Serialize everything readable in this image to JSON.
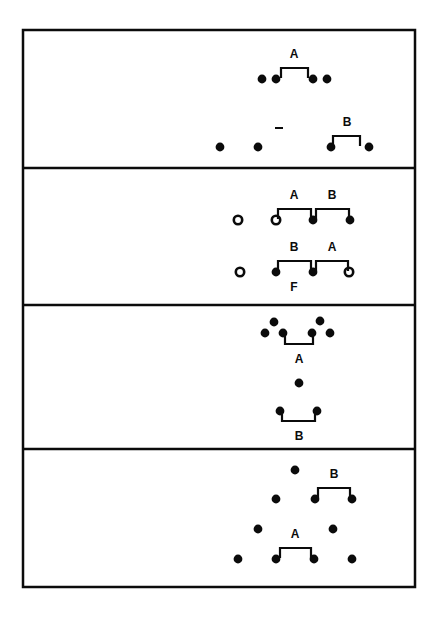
{
  "figure": {
    "background_color": "#ffffff",
    "ink_color": "#0b0b0b",
    "frame": {
      "x": 23,
      "y": 30,
      "width": 392,
      "height": 557,
      "stroke_width": 2.5
    },
    "dividers_y": [
      168,
      305,
      449
    ],
    "dot_radius": 4.4,
    "open_dot_radius": 4.2
  },
  "panels": [
    {
      "id": "panel-1",
      "index": 1,
      "label": "Panel 1",
      "bounds": {
        "x": 23,
        "y": 30,
        "width": 392,
        "height": 138
      },
      "dots": [
        {
          "id": "p1-d1",
          "x": 262,
          "y": 79,
          "fill": "filled"
        },
        {
          "id": "p1-d2",
          "x": 276,
          "y": 79,
          "fill": "filled"
        },
        {
          "id": "p1-d3",
          "x": 313,
          "y": 79,
          "fill": "filled"
        },
        {
          "id": "p1-d4",
          "x": 327,
          "y": 79,
          "fill": "filled"
        },
        {
          "id": "p1-d5",
          "x": 220,
          "y": 147,
          "fill": "filled"
        },
        {
          "id": "p1-d6",
          "x": 258,
          "y": 147,
          "fill": "filled"
        },
        {
          "id": "p1-d7",
          "x": 331,
          "y": 147,
          "fill": "filled"
        },
        {
          "id": "p1-d8",
          "x": 369,
          "y": 147,
          "fill": "filled"
        }
      ],
      "brackets": [
        {
          "id": "p1-bracket-a",
          "label": "A",
          "x1": 281,
          "x2": 308,
          "y": 68,
          "depth": 10,
          "orientation": "up",
          "label_x": 294,
          "label_y": 55
        },
        {
          "id": "p1-bracket-b",
          "label": "B",
          "x1": 333,
          "x2": 360,
          "y": 136,
          "depth": 10,
          "orientation": "up",
          "label_x": 347,
          "label_y": 123
        }
      ],
      "marks": [
        {
          "id": "p1-dash",
          "type": "dash",
          "x1": 275,
          "x2": 283,
          "y": 128
        }
      ]
    },
    {
      "id": "panel-2",
      "index": 2,
      "label": "Panel 2",
      "bounds": {
        "x": 23,
        "y": 168,
        "width": 392,
        "height": 137
      },
      "dots": [
        {
          "id": "p2-d1",
          "x": 238,
          "y": 220,
          "fill": "open"
        },
        {
          "id": "p2-d2",
          "x": 276,
          "y": 220,
          "fill": "open"
        },
        {
          "id": "p2-d3",
          "x": 313,
          "y": 220,
          "fill": "filled"
        },
        {
          "id": "p2-d4",
          "x": 350,
          "y": 220,
          "fill": "filled"
        },
        {
          "id": "p2-d5",
          "x": 240,
          "y": 272,
          "fill": "open"
        },
        {
          "id": "p2-d6",
          "x": 276,
          "y": 272,
          "fill": "filled"
        },
        {
          "id": "p2-d7",
          "x": 313,
          "y": 272,
          "fill": "filled"
        },
        {
          "id": "p2-d8",
          "x": 349,
          "y": 272,
          "fill": "open"
        }
      ],
      "brackets": [
        {
          "id": "p2-bracket-a",
          "label": "A",
          "x1": 278,
          "x2": 311,
          "y": 209,
          "depth": 10,
          "orientation": "up",
          "label_x": 294,
          "label_y": 196
        },
        {
          "id": "p2-bracket-b",
          "label": "B",
          "x1": 316,
          "x2": 349,
          "y": 209,
          "depth": 10,
          "orientation": "up",
          "label_x": 332,
          "label_y": 196
        },
        {
          "id": "p2-bracket-b2",
          "label": "B",
          "x1": 278,
          "x2": 311,
          "y": 261,
          "depth": 10,
          "orientation": "up",
          "label_x": 294,
          "label_y": 248
        },
        {
          "id": "p2-bracket-a2",
          "label": "A",
          "x1": 316,
          "x2": 348,
          "y": 261,
          "depth": 10,
          "orientation": "up",
          "label_x": 332,
          "label_y": 248
        }
      ],
      "extra_labels": [
        {
          "id": "p2-label-f",
          "text": "F",
          "x": 294,
          "y": 288
        }
      ]
    },
    {
      "id": "panel-3",
      "index": 3,
      "label": "Panel 3",
      "bounds": {
        "x": 23,
        "y": 305,
        "width": 392,
        "height": 144
      },
      "dots": [
        {
          "id": "p3-d1",
          "x": 274,
          "y": 322,
          "fill": "filled"
        },
        {
          "id": "p3-d2",
          "x": 320,
          "y": 321,
          "fill": "filled"
        },
        {
          "id": "p3-d3",
          "x": 265,
          "y": 333,
          "fill": "filled"
        },
        {
          "id": "p3-d4",
          "x": 283,
          "y": 333,
          "fill": "filled"
        },
        {
          "id": "p3-d5",
          "x": 312,
          "y": 333,
          "fill": "filled"
        },
        {
          "id": "p3-d6",
          "x": 330,
          "y": 333,
          "fill": "filled"
        },
        {
          "id": "p3-d7",
          "x": 299,
          "y": 383,
          "fill": "filled"
        },
        {
          "id": "p3-d8",
          "x": 280,
          "y": 411,
          "fill": "filled"
        },
        {
          "id": "p3-d9",
          "x": 317,
          "y": 411,
          "fill": "filled"
        }
      ],
      "brackets": [
        {
          "id": "p3-bracket-a",
          "label": "A",
          "x1": 285,
          "x2": 313,
          "y": 344,
          "depth": 10,
          "orientation": "down",
          "label_x": 299,
          "label_y": 360
        },
        {
          "id": "p3-bracket-b",
          "label": "B",
          "x1": 282,
          "x2": 315,
          "y": 421,
          "depth": 10,
          "orientation": "down",
          "label_x": 299,
          "label_y": 437
        }
      ]
    },
    {
      "id": "panel-4",
      "index": 4,
      "label": "Panel 4",
      "bounds": {
        "x": 23,
        "y": 449,
        "width": 392,
        "height": 138
      },
      "dots": [
        {
          "id": "p4-d1",
          "x": 295,
          "y": 470,
          "fill": "filled"
        },
        {
          "id": "p4-d2",
          "x": 276,
          "y": 499,
          "fill": "filled"
        },
        {
          "id": "p4-d3",
          "x": 315,
          "y": 499,
          "fill": "filled"
        },
        {
          "id": "p4-d4",
          "x": 352,
          "y": 499,
          "fill": "filled"
        },
        {
          "id": "p4-d5",
          "x": 258,
          "y": 529,
          "fill": "filled"
        },
        {
          "id": "p4-d6",
          "x": 333,
          "y": 529,
          "fill": "filled"
        },
        {
          "id": "p4-d7",
          "x": 238,
          "y": 559,
          "fill": "filled"
        },
        {
          "id": "p4-d8",
          "x": 276,
          "y": 559,
          "fill": "filled"
        },
        {
          "id": "p4-d9",
          "x": 314,
          "y": 559,
          "fill": "filled"
        },
        {
          "id": "p4-d10",
          "x": 352,
          "y": 559,
          "fill": "filled"
        }
      ],
      "brackets": [
        {
          "id": "p4-bracket-b",
          "label": "B",
          "x1": 318,
          "x2": 350,
          "y": 488,
          "depth": 10,
          "orientation": "up",
          "label_x": 334,
          "label_y": 475
        },
        {
          "id": "p4-bracket-a",
          "label": "A",
          "x1": 280,
          "x2": 311,
          "y": 548,
          "depth": 10,
          "orientation": "up",
          "label_x": 295,
          "label_y": 535
        }
      ]
    }
  ]
}
